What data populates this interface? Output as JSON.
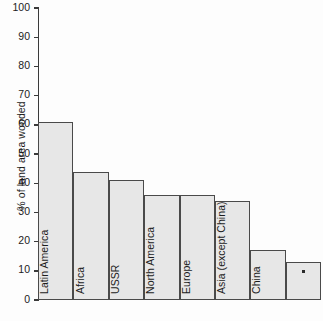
{
  "chart_data": {
    "type": "bar",
    "title": "",
    "xlabel": "",
    "ylabel": "% of land area wooded",
    "ylim": [
      0,
      100
    ],
    "yticks": [
      0,
      10,
      20,
      30,
      40,
      50,
      60,
      70,
      80,
      90,
      100
    ],
    "grid": false,
    "legend": "none",
    "categories": [
      "Latin America",
      "Africa",
      "USSR",
      "North America",
      "Europe",
      "Asia (except China)",
      "China",
      "*"
    ],
    "values": [
      61,
      44,
      41,
      36,
      36,
      34,
      17,
      13
    ],
    "annotations": [
      {
        "category_index": 7,
        "marker": "*",
        "note": "Last bar carries only a small asterisk marker instead of a name"
      }
    ],
    "colors": {
      "bar_fill": "#e7e7e7",
      "bar_stroke": "#4a4a4a",
      "axis": "#3a3a3a",
      "text": "#1c1c1c",
      "background": "#fdfdfd"
    }
  }
}
